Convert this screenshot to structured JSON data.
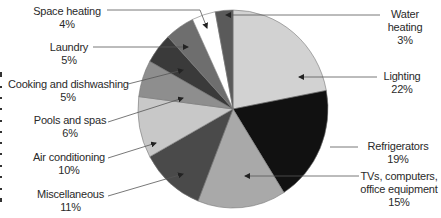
{
  "chart_data": {
    "type": "pie",
    "title": "",
    "start_angle": "12 o'clock, clockwise",
    "slices": [
      {
        "label": "Lighting",
        "value": 22,
        "pct": "22%",
        "color": "#d2d2d2"
      },
      {
        "label": "Refrigerators",
        "value": 19,
        "pct": "19%",
        "color": "#111111"
      },
      {
        "label": "TVs, computers, office equipment",
        "value": 15,
        "pct": "15%",
        "color": "#a9a9a9"
      },
      {
        "label": "Miscellaneous",
        "value": 11,
        "pct": "11%",
        "color": "#4a4a4a"
      },
      {
        "label": "Air conditioning",
        "value": 10,
        "pct": "10%",
        "color": "#c8c8c8"
      },
      {
        "label": "Pools and spas",
        "value": 6,
        "pct": "6%",
        "color": "#8e8e8e"
      },
      {
        "label": "Cooking and dishwashing",
        "value": 5,
        "pct": "5%",
        "color": "#3a3a3a"
      },
      {
        "label": "Laundry",
        "value": 5,
        "pct": "5%",
        "color": "#6e6e6e"
      },
      {
        "label": "Space heating",
        "value": 4,
        "pct": "4%",
        "color": "#ffffff"
      },
      {
        "label": "Water heating",
        "value": 3,
        "pct": "3%",
        "color": "#5a5a5a"
      }
    ],
    "legend": "callout labels with leader lines"
  },
  "labels": {
    "space_heating": {
      "name": "Space heating",
      "pct": "4%"
    },
    "laundry": {
      "name": "Laundry",
      "pct": "5%"
    },
    "cooking": {
      "name": "Cooking and dishwashing",
      "pct": "5%"
    },
    "pools": {
      "name": "Pools and spas",
      "pct": "6%"
    },
    "air_conditioning": {
      "name": "Air conditioning",
      "pct": "10%"
    },
    "miscellaneous": {
      "name": "Miscellaneous",
      "pct": "11%"
    },
    "water_heating": {
      "name1": "Water",
      "name2": "heating",
      "pct": "3%"
    },
    "lighting": {
      "name": "Lighting",
      "pct": "22%"
    },
    "refrigerators": {
      "name": "Refrigerators",
      "pct": "19%"
    },
    "tvs": {
      "name1": "TVs, computers,",
      "name2": "office equipment",
      "pct": "15%"
    }
  }
}
